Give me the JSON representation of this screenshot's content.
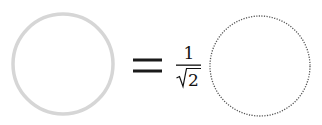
{
  "diagram": {
    "left_circle": {
      "cx": 63,
      "cy": 64,
      "r": 50,
      "stroke": "#d6d6d6",
      "stroke_width": 3.5,
      "style": "solid"
    },
    "operator": "=",
    "coefficient": {
      "numerator": "1",
      "denominator_radical": "√",
      "denominator_value": "2"
    },
    "right_circle": {
      "cx": 260,
      "cy": 66,
      "r": 50,
      "stroke": "#555555",
      "stroke_width": 1.3,
      "style": "dotted"
    }
  }
}
